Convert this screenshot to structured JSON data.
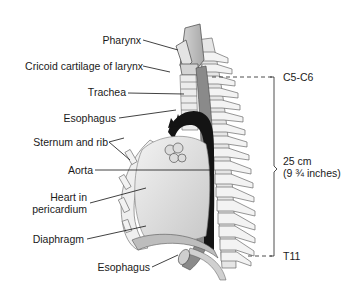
{
  "figure": {
    "labels": {
      "pharynx": "Pharynx",
      "cricoid": "Cricoid cartilage of larynx",
      "trachea": "Trachea",
      "esophagus_upper": "Esophagus",
      "sternum_rib": "Sternum and rib",
      "aorta": "Aorta",
      "heart_line1": "Heart in",
      "heart_line2": "pericardium",
      "diaphragm": "Diaphragm",
      "esophagus_lower": "Esophagus"
    },
    "measurement": {
      "top_vertebra": "C5-C6",
      "length_cm": "25 cm",
      "length_in": "(9 ¾ inches)",
      "bottom_vertebra": "T11"
    }
  }
}
